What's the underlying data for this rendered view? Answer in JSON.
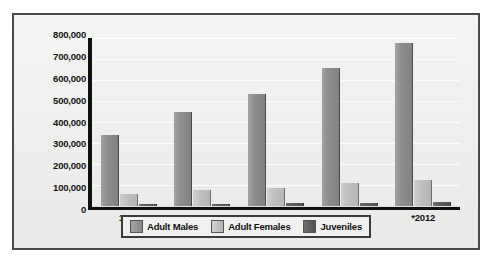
{
  "chart_data": {
    "type": "bar",
    "title": "",
    "subtitle": "",
    "xlabel": "",
    "ylabel": "",
    "categories": [
      "1990",
      "1995",
      "2000",
      "2005",
      "*2012"
    ],
    "series": [
      {
        "name": "Adult Males",
        "color": "#8e8e8e",
        "values": [
          340000,
          450000,
          535000,
          655000,
          775000
        ]
      },
      {
        "name": "Adult Females",
        "color": "#c0c0c0",
        "values": [
          55000,
          75000,
          85000,
          110000,
          125000
        ]
      },
      {
        "name": "Juveniles",
        "color": "#5c5c5c",
        "values": [
          8000,
          10000,
          12000,
          15000,
          18000
        ]
      }
    ],
    "ylim": [
      0,
      800000
    ],
    "ytick_step": 100000,
    "yticks": [
      "800,000",
      "700,000",
      "600,000",
      "500,000",
      "400,000",
      "300,000",
      "200,000",
      "100,000",
      "0"
    ],
    "grid": true,
    "legend_position": "bottom-center",
    "footnote_marker": "*"
  }
}
